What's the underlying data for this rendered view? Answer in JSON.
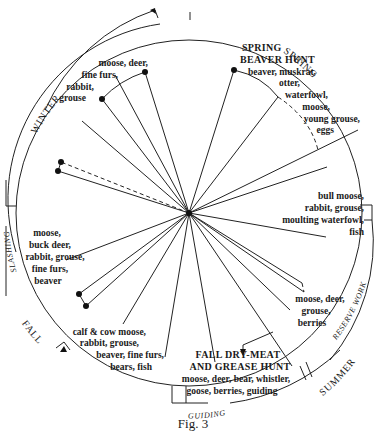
{
  "figure": {
    "caption": "Fig. 3",
    "center": [
      189,
      213
    ],
    "colors": {
      "ink": "#1a1a1a",
      "paper": "#ffffff"
    }
  },
  "seasons": [
    {
      "id": "winter",
      "label": "WINTER"
    },
    {
      "id": "spring",
      "label": "SPRING"
    },
    {
      "id": "summer",
      "label": "SUMMER"
    },
    {
      "id": "fall",
      "label": "FALL"
    }
  ],
  "activities": [
    {
      "id": "slashing",
      "label": "SLASHING"
    },
    {
      "id": "reserve-work",
      "label": "RESERVE WORK"
    },
    {
      "id": "guiding",
      "label": "GUIDING"
    }
  ],
  "hunts": {
    "spring_beaver": {
      "title_line1": "SPRING",
      "title_line2": "BEAVER HUNT"
    },
    "fall_drymeat": {
      "title_line1": "FALL DRY-MEAT",
      "title_line2": "AND GREASE HUNT"
    }
  },
  "resource_labels": {
    "winter": [
      "moose, deer,",
      "fine furs,",
      "rabbit,",
      "grouse"
    ],
    "spring": [
      "beaver, muskrat,",
      "otter,",
      "waterfowl,",
      "moose,",
      "young grouse,",
      "eggs"
    ],
    "early_summer": [
      "bull moose,",
      "rabbit, grouse,",
      "moulting waterfowl,",
      "fish"
    ],
    "late_summer": [
      "moose, deer,",
      "grouse,",
      "berries"
    ],
    "fall_drymeat": [
      "moose, deer, bear, whistler,",
      "goose, berries, guiding"
    ],
    "fall": [
      "calf & cow moose,",
      "rabbit, grouse,",
      "beaver, fine furs,",
      "bears, fish"
    ],
    "early_winter": [
      "moose,",
      "buck deer,",
      "rabbit, grouse,",
      "fine furs,",
      "beaver"
    ]
  }
}
